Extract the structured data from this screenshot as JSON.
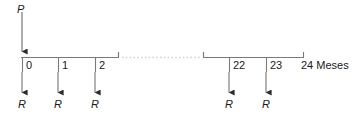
{
  "diagram": {
    "type": "cash-flow-timeline",
    "title_symbol": "P",
    "inflow_label": "P",
    "outflow_label": "R",
    "axis_end_label": "24 Meses",
    "colors": {
      "line": "#7a7a7a",
      "arrow": "#2b2b2b",
      "text": "#1a1a1a",
      "dotted": "#cfcfcf",
      "background": "#ffffff"
    },
    "axis": {
      "start_tick_label": "0",
      "ticks": [
        {
          "label": "0",
          "x": 22
        },
        {
          "label": "1",
          "x": 58
        },
        {
          "label": "2",
          "x": 95
        },
        {
          "label": "22",
          "x": 229
        },
        {
          "label": "23",
          "x": 266
        },
        {
          "label": "24 Meses",
          "x": 303
        }
      ],
      "break_marks": [
        118,
        203
      ],
      "dotted_span": [
        121,
        200
      ]
    },
    "arrows_down": [
      {
        "label": "R",
        "x": 22
      },
      {
        "label": "R",
        "x": 58
      },
      {
        "label": "R",
        "x": 95
      },
      {
        "label": "R",
        "x": 229
      },
      {
        "label": "R",
        "x": 266
      }
    ],
    "arrow_in": {
      "label": "P",
      "x": 22,
      "from_y": 12,
      "to_y": 58
    }
  }
}
